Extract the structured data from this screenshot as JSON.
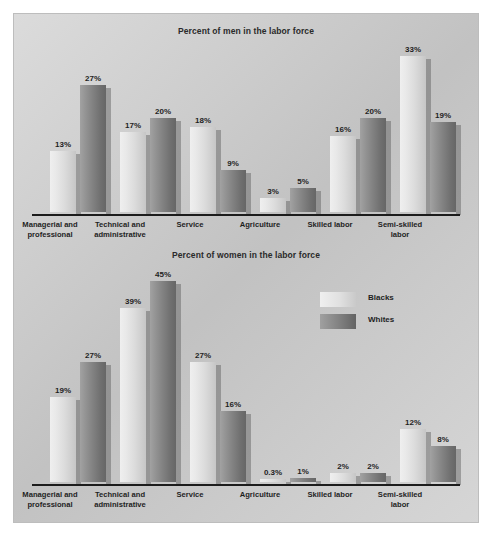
{
  "figure": {
    "background_color": "#c8c8c8",
    "page_background": "#ffffff"
  },
  "legend": {
    "position": "middle-right of lower chart",
    "entries": [
      {
        "label": "Blacks",
        "color": "#e0e0e0"
      },
      {
        "label": "Whites",
        "color": "#808080"
      }
    ]
  },
  "chart_data": [
    {
      "type": "bar",
      "title": "Percent of men in the labor force",
      "xlabel": "",
      "ylabel": "",
      "ylim": [
        0,
        36
      ],
      "grid": false,
      "legend_position": "none",
      "categories": [
        "Managerial and professional",
        "Technical and administrative",
        "Service",
        "Agriculture",
        "Skilled labor",
        "Semi-skilled labor"
      ],
      "series": [
        {
          "name": "Blacks",
          "color": "#e0e0e0",
          "values": [
            13,
            17,
            18,
            3,
            16,
            33
          ],
          "labels": [
            "13%",
            "17%",
            "18%",
            "3%",
            "16%",
            "33%"
          ]
        },
        {
          "name": "Whites",
          "color": "#808080",
          "values": [
            27,
            20,
            9,
            5,
            20,
            19
          ],
          "labels": [
            "27%",
            "20%",
            "9%",
            "5%",
            "20%",
            "19%"
          ]
        }
      ]
    },
    {
      "type": "bar",
      "title": "Percent of women in the labor force",
      "xlabel": "",
      "ylabel": "",
      "ylim": [
        0,
        48
      ],
      "grid": false,
      "legend_position": "upper-right",
      "categories": [
        "Managerial and professional",
        "Technical and administrative",
        "Service",
        "Agriculture",
        "Skilled labor",
        "Semi-skilled labor"
      ],
      "series": [
        {
          "name": "Blacks",
          "color": "#e0e0e0",
          "values": [
            19,
            39,
            27,
            0.3,
            2,
            12
          ],
          "labels": [
            "19%",
            "39%",
            "27%",
            "0.3%",
            "2%",
            "12%"
          ]
        },
        {
          "name": "Whites",
          "color": "#808080",
          "values": [
            27,
            45,
            16,
            1,
            2,
            8
          ],
          "labels": [
            "27%",
            "45%",
            "16%",
            "1%",
            "2%",
            "8%"
          ]
        }
      ]
    }
  ]
}
